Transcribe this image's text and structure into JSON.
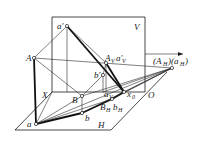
{
  "figure": {
    "type": "descriptive-geometry projection diagram",
    "planes": {
      "vertical": "V",
      "horizontal": "H"
    },
    "axis": {
      "name": "X",
      "origin": "O"
    },
    "labels": {
      "A": "A",
      "a_prime": "a′",
      "A_V": "A",
      "A_V_sub": "V",
      "a_V_prime": "a′",
      "a_V_prime_sub": "V",
      "b_prime": "b′",
      "B": "B",
      "a_V": "a",
      "a_V_sub": "V",
      "B_H": "B",
      "B_H_sub": "H",
      "b_H": "b",
      "b_H_sub": "H",
      "x0": "x",
      "x0_sub": "0",
      "a": "a",
      "b": "b",
      "A_H_group": "(A",
      "A_H_sub": "H",
      "A_H_close": ")(a",
      "a_H_sub": "H",
      "a_H_close": ")"
    },
    "colors": {
      "line": "#1a1a1a",
      "background": "#ffffff"
    }
  }
}
